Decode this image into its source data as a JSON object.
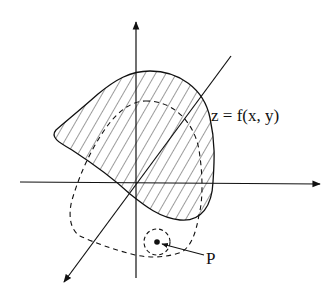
{
  "figure": {
    "surface_label": "z = f(x, y)",
    "point_label": "P",
    "colors": {
      "stroke": "#111111",
      "background": "#ffffff"
    },
    "elements": [
      "z-axis (vertical, arrow up)",
      "x-axis (horizontal, arrow right)",
      "y-axis (diagonal, arrow toward lower-left)",
      "hatched surface region z = f(x, y)",
      "dashed projected domain in the plane",
      "dashed neighborhood circle around point P",
      "point P with arrow pointer"
    ]
  }
}
